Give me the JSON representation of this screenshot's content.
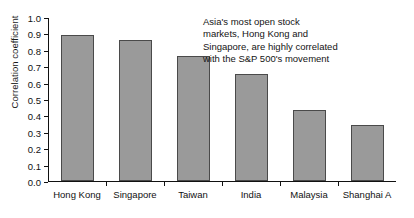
{
  "chart_data": {
    "type": "bar",
    "title": "",
    "xlabel": "",
    "ylabel": "Correlation coefficient",
    "categories": [
      "Hong Kong",
      "Singapore",
      "Taiwan",
      "India",
      "Malaysia",
      "Shanghai A"
    ],
    "values": [
      0.89,
      0.86,
      0.76,
      0.65,
      0.43,
      0.34
    ],
    "ylim": [
      0.0,
      1.0
    ],
    "ytick_labels": [
      "0.0",
      "0.1",
      "0.2",
      "0.3",
      "0.4",
      "0.5",
      "0.6",
      "0.7",
      "0.8",
      "0.9",
      "1.0"
    ],
    "ytick_values": [
      0.0,
      0.1,
      0.2,
      0.3,
      0.4,
      0.5,
      0.6,
      0.7,
      0.8,
      0.9,
      1.0
    ],
    "grid": false,
    "legend": false,
    "bar_color": "#9a9a9a",
    "bar_edge_color": "#4a4a4a",
    "axis_color": "#111111",
    "annotation": {
      "lines": [
        "Asia's most open stock",
        "markets, Hong Kong and",
        "Singapore, are highly correlated",
        "with the S&P 500's movement"
      ]
    }
  }
}
